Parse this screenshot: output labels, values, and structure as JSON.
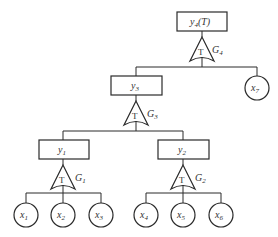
{
  "diagram": {
    "type": "fault-tree",
    "top_event": {
      "label": "y4(T)",
      "main": "y",
      "sub": "4",
      "suffix": "(T)"
    },
    "intermediate_events": [
      {
        "id": "y3",
        "main": "y",
        "sub": "3"
      },
      {
        "id": "y1",
        "main": "y",
        "sub": "1"
      },
      {
        "id": "y2",
        "main": "y",
        "sub": "2"
      }
    ],
    "basic_events": [
      {
        "id": "x1",
        "main": "x",
        "sub": "1"
      },
      {
        "id": "x2",
        "main": "x",
        "sub": "2"
      },
      {
        "id": "x3",
        "main": "x",
        "sub": "3"
      },
      {
        "id": "x4",
        "main": "x",
        "sub": "4"
      },
      {
        "id": "x5",
        "main": "x",
        "sub": "5"
      },
      {
        "id": "x6",
        "main": "x",
        "sub": "6"
      },
      {
        "id": "x7",
        "main": "x",
        "sub": "7"
      }
    ],
    "gates": [
      {
        "id": "G4",
        "main": "G",
        "sub": "4",
        "symbol": "T",
        "inputs": [
          "y3",
          "x7"
        ],
        "output": "y4(T)"
      },
      {
        "id": "G3",
        "main": "G",
        "sub": "3",
        "symbol": "T",
        "inputs": [
          "y1",
          "y2"
        ],
        "output": "y3"
      },
      {
        "id": "G1",
        "main": "G",
        "sub": "1",
        "symbol": "T",
        "inputs": [
          "x1",
          "x2",
          "x3"
        ],
        "output": "y1"
      },
      {
        "id": "G2",
        "main": "G",
        "sub": "2",
        "symbol": "T",
        "inputs": [
          "x4",
          "x5",
          "x6"
        ],
        "output": "y2"
      }
    ]
  }
}
